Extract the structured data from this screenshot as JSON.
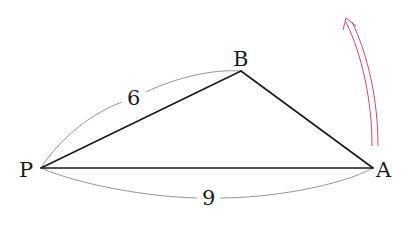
{
  "diagram": {
    "type": "geometry-triangle",
    "points": {
      "P": {
        "label": "P",
        "x": 41,
        "y": 168
      },
      "B": {
        "label": "B",
        "x": 241,
        "y": 71
      },
      "A": {
        "label": "A",
        "x": 373,
        "y": 168
      }
    },
    "segments": [
      {
        "from": "P",
        "to": "B"
      },
      {
        "from": "B",
        "to": "A"
      },
      {
        "from": "P",
        "to": "A"
      }
    ],
    "measurements": {
      "PB": {
        "label": "6"
      },
      "PA": {
        "label": "9"
      }
    },
    "arrow": {
      "description": "curved double-line arrow pointing upward near A",
      "color": "#c8325a"
    },
    "colors": {
      "edge": "#1a1a1a",
      "dimension_arc": "#8a8a8a",
      "arrow": "#c8325a",
      "background": "#ffffff"
    }
  }
}
